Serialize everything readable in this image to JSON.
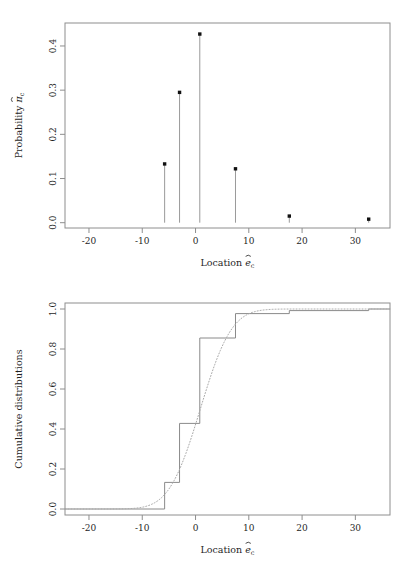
{
  "figure": {
    "panels": [
      "probability-mass-panel",
      "cumulative-distribution-panel"
    ],
    "background": "#ffffff",
    "point_color": "#111111",
    "line_color": "#8e8e8e"
  },
  "chart_data": [
    {
      "type": "bar",
      "id": "probability-mass",
      "title": "",
      "xlabel": "Location ê_c",
      "ylabel": "Probability π̂_c",
      "xlabel_parts": {
        "word": "Location",
        "symbol": "e",
        "hat": true,
        "subscript": "c"
      },
      "ylabel_parts": {
        "word": "Probability",
        "symbol": "π",
        "hat": true,
        "subscript": "c"
      },
      "xlim": [
        -24.5,
        36.5
      ],
      "ylim": [
        -0.012,
        0.452
      ],
      "xticks": [
        -20,
        -10,
        0,
        10,
        20,
        30
      ],
      "xticklabels": [
        "-20",
        "-10",
        "0",
        "10",
        "20",
        "30"
      ],
      "yticks": [
        0.0,
        0.1,
        0.2,
        0.3,
        0.4
      ],
      "yticklabels": [
        "0.0",
        "0.1",
        "0.2",
        "0.3",
        "0.4"
      ],
      "grid": false,
      "legend": null,
      "marker": "filled-square",
      "x": [
        -5.8,
        -3.0,
        0.8,
        7.5,
        17.6,
        32.5
      ],
      "values": [
        0.133,
        0.295,
        0.427,
        0.122,
        0.015,
        0.008
      ]
    },
    {
      "type": "line",
      "id": "cumulative-distributions",
      "title": "",
      "xlabel": "Location ê_c",
      "ylabel": "Cumulative distributions",
      "xlabel_parts": {
        "word": "Location",
        "symbol": "e",
        "hat": true,
        "subscript": "c"
      },
      "xlim": [
        -24.5,
        36.5
      ],
      "ylim": [
        -0.03,
        1.03
      ],
      "xticks": [
        -20,
        -10,
        0,
        10,
        20,
        30
      ],
      "xticklabels": [
        "-20",
        "-10",
        "0",
        "10",
        "20",
        "30"
      ],
      "yticks": [
        0.0,
        0.2,
        0.4,
        0.6,
        0.8,
        1.0
      ],
      "yticklabels": [
        "0.0",
        "0.2",
        "0.4",
        "0.6",
        "0.8",
        "1.0"
      ],
      "grid": false,
      "legend": null,
      "series": [
        {
          "name": "empirical-step-cdf",
          "style": "step",
          "x": [
            -5.8,
            -3.0,
            0.8,
            7.5,
            17.6,
            32.5
          ],
          "values": [
            0.133,
            0.428,
            0.855,
            0.977,
            0.992,
            1.0
          ]
        },
        {
          "name": "fitted-smooth-cdf",
          "style": "dotted",
          "distribution": "normal",
          "mean": 0.9,
          "sd": 4.6
        }
      ]
    }
  ]
}
